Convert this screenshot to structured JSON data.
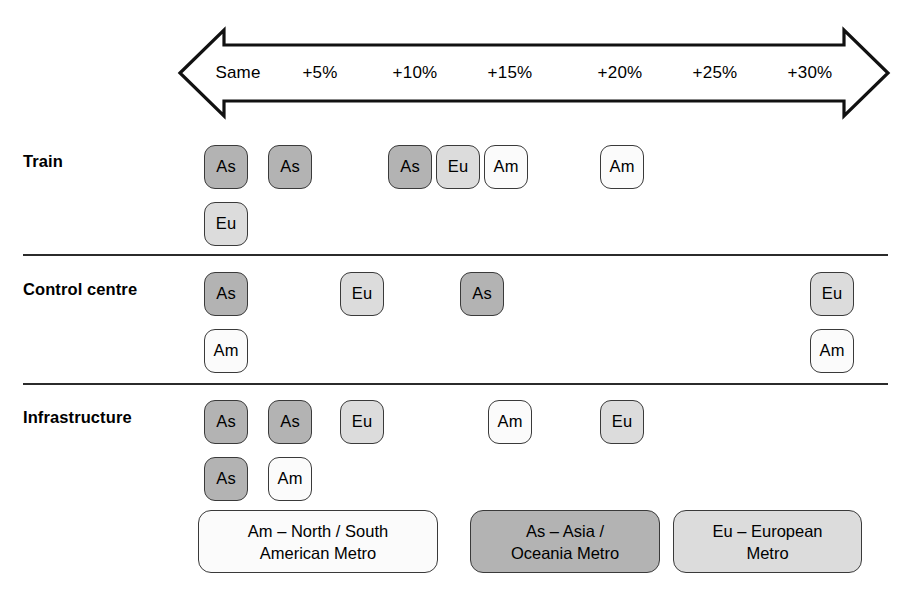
{
  "scale": {
    "name": "cost-increase-scale",
    "labels": [
      "Same",
      "+5%",
      "+10%",
      "+15%",
      "+20%",
      "+25%",
      "+30%"
    ],
    "positions_px": [
      238,
      320,
      415,
      510,
      620,
      715,
      810
    ]
  },
  "rows": [
    {
      "label": "Train",
      "key": "train",
      "chips": [
        {
          "code": "As",
          "type": "as",
          "x": 204,
          "stack": 0
        },
        {
          "code": "Eu",
          "type": "eu",
          "x": 204,
          "stack": 1
        },
        {
          "code": "As",
          "type": "as",
          "x": 268,
          "stack": 0
        },
        {
          "code": "As",
          "type": "as",
          "x": 388,
          "stack": 0
        },
        {
          "code": "Eu",
          "type": "eu",
          "x": 436,
          "stack": 0
        },
        {
          "code": "Am",
          "type": "am",
          "x": 484,
          "stack": 0
        },
        {
          "code": "Am",
          "type": "am",
          "x": 600,
          "stack": 0
        }
      ]
    },
    {
      "label": "Control centre",
      "key": "control-centre",
      "chips": [
        {
          "code": "As",
          "type": "as",
          "x": 204,
          "stack": 0
        },
        {
          "code": "Am",
          "type": "am",
          "x": 204,
          "stack": 1
        },
        {
          "code": "Eu",
          "type": "eu",
          "x": 340,
          "stack": 0
        },
        {
          "code": "As",
          "type": "as",
          "x": 460,
          "stack": 0
        },
        {
          "code": "Eu",
          "type": "eu",
          "x": 810,
          "stack": 0
        },
        {
          "code": "Am",
          "type": "am",
          "x": 810,
          "stack": 1
        }
      ]
    },
    {
      "label": "Infrastructure",
      "key": "infrastructure",
      "chips": [
        {
          "code": "As",
          "type": "as",
          "x": 204,
          "stack": 0
        },
        {
          "code": "As",
          "type": "as",
          "x": 204,
          "stack": 1
        },
        {
          "code": "As",
          "type": "as",
          "x": 268,
          "stack": 0
        },
        {
          "code": "Am",
          "type": "am",
          "x": 268,
          "stack": 1
        },
        {
          "code": "Eu",
          "type": "eu",
          "x": 340,
          "stack": 0
        },
        {
          "code": "Am",
          "type": "am",
          "x": 488,
          "stack": 0
        },
        {
          "code": "Eu",
          "type": "eu",
          "x": 600,
          "stack": 0
        }
      ]
    }
  ],
  "legend": [
    {
      "code": "Am",
      "type": "am",
      "text": "Am – North / South\nAmerican Metro",
      "x": 198,
      "width": 240
    },
    {
      "code": "As",
      "type": "as",
      "text": "As – Asia /\nOceania Metro",
      "x": 470,
      "width": 190
    },
    {
      "code": "Eu",
      "type": "eu",
      "text": "Eu – European\nMetro",
      "x": 673,
      "width": 189
    }
  ],
  "colors": {
    "asia_oceania": "#b3b3b3",
    "european": "#dcdcdc",
    "american": "#fbfbfb",
    "outline": "#3a3a3a"
  }
}
